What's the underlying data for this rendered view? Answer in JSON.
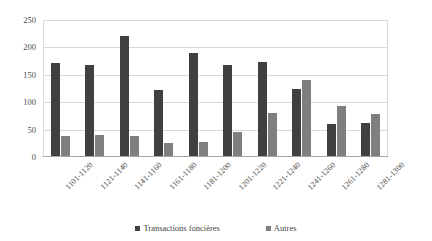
{
  "chart_data": {
    "type": "bar",
    "title": "",
    "subtitle": "",
    "xlabel": "",
    "ylabel": "",
    "categories": [
      "1101-1120",
      "1121-1140",
      "1141-1160",
      "1161-1180",
      "1181-1200",
      "1201-1220",
      "1221-1240",
      "1241-1260",
      "1261-1280",
      "1281-1300"
    ],
    "series": [
      {
        "name": "Transactions foncières",
        "color": "#404040",
        "values": [
          172,
          168,
          221,
          122,
          190,
          167,
          173,
          125,
          60,
          62
        ]
      },
      {
        "name": "Autres",
        "color": "#7f7f7f",
        "values": [
          38,
          40,
          38,
          25,
          28,
          45,
          80,
          140,
          93,
          78
        ]
      }
    ],
    "ylim": [
      0,
      250
    ],
    "ytick_labels": [
      "0",
      "50",
      "100",
      "150",
      "200",
      "250"
    ],
    "ytick_values": [
      0,
      50,
      100,
      150,
      200,
      250
    ],
    "grid": true,
    "legend_position": "bottom",
    "xtick_rotation": -45
  },
  "legend": {
    "items": [
      {
        "label": "Transactions foncières"
      },
      {
        "label": "Autres"
      }
    ]
  }
}
